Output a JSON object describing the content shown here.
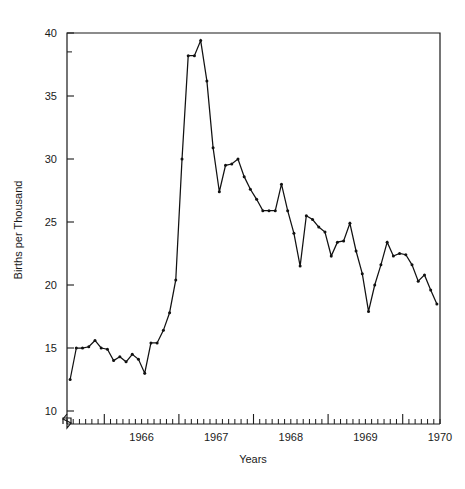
{
  "chart_data": {
    "type": "line",
    "title": "",
    "xlabel": "Years",
    "ylabel": "Births per Thousand",
    "ylim": [
      9,
      40
    ],
    "xlim": [
      1965.5,
      1970.5
    ],
    "grid": false,
    "legend": "none",
    "y_ticks": [
      10,
      15,
      20,
      25,
      30,
      35,
      40
    ],
    "y_tick_labels": [
      "10",
      "15",
      "20",
      "25",
      "30",
      "35",
      "40"
    ],
    "x_ticks": [
      1966,
      1967,
      1968,
      1969,
      1970
    ],
    "x_tick_labels": [
      "1966",
      "1967",
      "1968",
      "1969",
      "1970"
    ],
    "x_minor_tick_interval_months": 1,
    "axis_break": true,
    "axis_break_note": "y-axis broken below 10",
    "marker": "dot",
    "line_color": "#111111",
    "series": [
      {
        "name": "Births per Thousand",
        "x": [
          1965.542,
          1965.625,
          1965.708,
          1965.792,
          1965.875,
          1965.958,
          1966.042,
          1966.125,
          1966.208,
          1966.292,
          1966.375,
          1966.458,
          1966.542,
          1966.625,
          1966.708,
          1966.792,
          1966.875,
          1966.958,
          1967.042,
          1967.125,
          1967.208,
          1967.292,
          1967.375,
          1967.458,
          1967.542,
          1967.625,
          1967.708,
          1967.792,
          1967.875,
          1967.958,
          1968.042,
          1968.125,
          1968.208,
          1968.292,
          1968.375,
          1968.458,
          1968.542,
          1968.625,
          1968.708,
          1968.792,
          1968.875,
          1968.958,
          1969.042,
          1969.125,
          1969.208,
          1969.292,
          1969.375,
          1969.458,
          1969.542,
          1969.625,
          1969.708,
          1969.792,
          1969.875,
          1969.958,
          1970.042,
          1970.125,
          1970.208,
          1970.292,
          1970.375,
          1970.458
        ],
        "values": [
          12.5,
          15.0,
          15.0,
          15.1,
          15.6,
          15.0,
          14.9,
          14.0,
          14.3,
          13.9,
          14.5,
          14.1,
          13.0,
          15.4,
          15.4,
          16.4,
          17.8,
          20.4,
          30.0,
          38.2,
          38.2,
          39.4,
          36.2,
          30.9,
          27.4,
          29.5,
          29.6,
          30.0,
          28.6,
          27.6,
          26.8,
          25.9,
          25.9,
          25.9,
          28.0,
          25.9,
          24.1,
          21.5,
          25.5,
          25.2,
          24.6,
          24.2,
          22.3,
          23.4,
          23.5,
          24.9,
          22.7,
          20.9,
          17.9,
          20.0,
          21.6,
          23.4,
          22.3,
          22.5,
          22.4,
          21.6,
          20.3,
          20.8,
          19.6,
          18.5
        ]
      }
    ]
  },
  "axes": {
    "y_axis_label": "Births per Thousand",
    "x_axis_label": "Years"
  }
}
